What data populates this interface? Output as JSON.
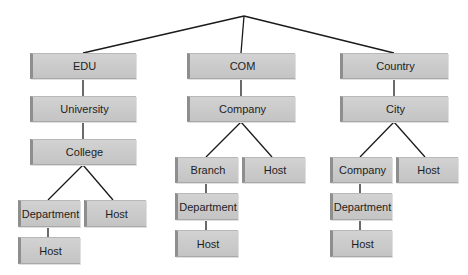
{
  "diagram": {
    "type": "tree",
    "root": {
      "label": ""
    },
    "nodes": [
      {
        "id": "edu",
        "label": "EDU",
        "x": 30,
        "y": 53,
        "w": 106,
        "h": 26
      },
      {
        "id": "university",
        "label": "University",
        "x": 30,
        "y": 96,
        "w": 106,
        "h": 26
      },
      {
        "id": "college",
        "label": "College",
        "x": 30,
        "y": 139,
        "w": 106,
        "h": 26
      },
      {
        "id": "edu-department",
        "label": "Department",
        "x": 18,
        "y": 200,
        "w": 62,
        "h": 27
      },
      {
        "id": "edu-host",
        "label": "Host",
        "x": 84,
        "y": 200,
        "w": 62,
        "h": 27
      },
      {
        "id": "edu-department-host",
        "label": "Host",
        "x": 18,
        "y": 237,
        "w": 62,
        "h": 27
      },
      {
        "id": "com",
        "label": "COM",
        "x": 187,
        "y": 53,
        "w": 108,
        "h": 26
      },
      {
        "id": "company",
        "label": "Company",
        "x": 187,
        "y": 96,
        "w": 108,
        "h": 26
      },
      {
        "id": "branch",
        "label": "Branch",
        "x": 175,
        "y": 157,
        "w": 63,
        "h": 26
      },
      {
        "id": "com-host",
        "label": "Host",
        "x": 242,
        "y": 157,
        "w": 63,
        "h": 26
      },
      {
        "id": "branch-department",
        "label": "Department",
        "x": 175,
        "y": 193,
        "w": 63,
        "h": 27
      },
      {
        "id": "branch-department-host",
        "label": "Host",
        "x": 175,
        "y": 230,
        "w": 63,
        "h": 27
      },
      {
        "id": "country",
        "label": "Country",
        "x": 340,
        "y": 53,
        "w": 108,
        "h": 26
      },
      {
        "id": "city",
        "label": "City",
        "x": 340,
        "y": 96,
        "w": 108,
        "h": 26
      },
      {
        "id": "city-company",
        "label": "Company",
        "x": 330,
        "y": 157,
        "w": 62,
        "h": 26
      },
      {
        "id": "city-host",
        "label": "Host",
        "x": 396,
        "y": 157,
        "w": 62,
        "h": 26
      },
      {
        "id": "city-company-department",
        "label": "Department",
        "x": 330,
        "y": 193,
        "w": 62,
        "h": 27
      },
      {
        "id": "city-company-department-host",
        "label": "Host",
        "x": 330,
        "y": 230,
        "w": 62,
        "h": 27
      }
    ],
    "colors": {
      "node_fill": "#c8c8c8",
      "node_edge": "#8e8e8e",
      "line": "#1a1a1a",
      "text": "#1e1e1e"
    }
  }
}
